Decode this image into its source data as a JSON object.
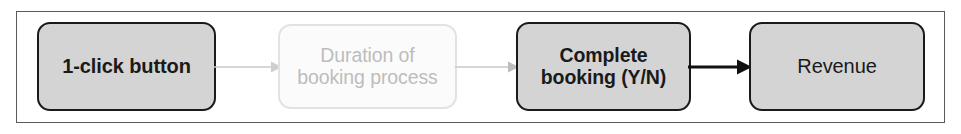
{
  "diagram": {
    "type": "flow-diagram",
    "frame": {
      "border_color": "#5a5a5a",
      "background": "#ffffff"
    },
    "nodes": [
      {
        "id": "one-click-button",
        "label": "1-click button",
        "state": "active",
        "emphasis": "bold",
        "fill": "#d4d4d4",
        "border_color": "#1a1a1a",
        "text_color": "#1a1a1a"
      },
      {
        "id": "duration-booking-process",
        "label": "Duration of\nbooking process",
        "state": "faded",
        "emphasis": "regular",
        "fill": "#fbfbfb",
        "border_color": "#e2e2e2",
        "text_color": "#bdbdbd"
      },
      {
        "id": "complete-booking",
        "label": "Complete\nbooking (Y/N)",
        "state": "active",
        "emphasis": "bold",
        "fill": "#d4d4d4",
        "border_color": "#1a1a1a",
        "text_color": "#1a1a1a"
      },
      {
        "id": "revenue",
        "label": "Revenue",
        "state": "active",
        "emphasis": "regular",
        "fill": "#d4d4d4",
        "border_color": "#1a1a1a",
        "text_color": "#1a1a1a"
      }
    ],
    "connectors": [
      {
        "id": "connector-1",
        "from": "one-click-button",
        "to": "duration-booking-process",
        "style": "faded",
        "color": "#c9c9c9",
        "stroke_width": 1.6
      },
      {
        "id": "connector-2",
        "from": "duration-booking-process",
        "to": "complete-booking",
        "style": "faded",
        "color": "#c9c9c9",
        "stroke_width": 1.6
      },
      {
        "id": "connector-3",
        "from": "complete-booking",
        "to": "revenue",
        "style": "solid",
        "color": "#111111",
        "stroke_width": 3.2
      }
    ]
  }
}
